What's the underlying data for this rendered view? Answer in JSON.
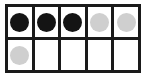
{
  "figure": {
    "name": "ten-frame",
    "type": "ten-frame-counter-diagram",
    "rows": 2,
    "columns": 5,
    "background_color": "#ffffff",
    "border_color": "#1a1a1a",
    "border_width_px": 3,
    "counter_colors": {
      "dark": "#141414",
      "light": "#cfcfcf"
    },
    "counts": {
      "dark_counters": 3,
      "light_counters": 3,
      "filled_cells": 6,
      "empty_cells": 4,
      "total_cells": 10
    },
    "grid": [
      [
        {
          "cell": "r1c1",
          "counter": "dark",
          "label": ""
        },
        {
          "cell": "r1c2",
          "counter": "dark",
          "label": ""
        },
        {
          "cell": "r1c3",
          "counter": "dark",
          "label": ""
        },
        {
          "cell": "r1c4",
          "counter": "light",
          "label": ""
        },
        {
          "cell": "r1c5",
          "counter": "light",
          "label": ""
        }
      ],
      [
        {
          "cell": "r2c1",
          "counter": "light",
          "label": ""
        },
        {
          "cell": "r2c2",
          "counter": "empty",
          "label": ""
        },
        {
          "cell": "r2c3",
          "counter": "empty",
          "label": ""
        },
        {
          "cell": "r2c4",
          "counter": "empty",
          "label": ""
        },
        {
          "cell": "r2c5",
          "counter": "empty",
          "label": ""
        }
      ]
    ]
  }
}
